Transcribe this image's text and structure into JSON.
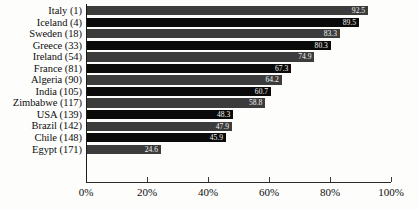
{
  "chart_data": {
    "type": "bar",
    "orientation": "horizontal",
    "title": "",
    "subtitle": "",
    "xlabel": "",
    "ylabel": "",
    "xlim": [
      0,
      100
    ],
    "grid": false,
    "legend": null,
    "value_suffix": "%",
    "categories": [
      "Italy (1)",
      "Iceland (4)",
      "Sweden (18)",
      "Greece (33)",
      "Ireland (54)",
      "France (81)",
      "Algeria (90)",
      "India (105)",
      "Zimbabwe (117)",
      "USA (139)",
      "Brazil (142)",
      "Chile (148)",
      "Egypt (171)"
    ],
    "values": [
      92.5,
      89.5,
      83.3,
      80.3,
      74.9,
      67.3,
      64.2,
      60.7,
      58.8,
      48.3,
      47.9,
      45.9,
      24.6
    ],
    "value_labels": [
      "92.5",
      "89.5",
      "83.3",
      "80.3",
      "74.9",
      "67.3",
      "64.2",
      "60.7",
      "58.8",
      "48.3",
      "47.9",
      "45.9",
      "24.6"
    ],
    "bar_colors": [
      "#3c3c3c",
      "#0a0a0a"
    ],
    "xticks": [
      0,
      20,
      40,
      60,
      80,
      100
    ],
    "xtick_labels": [
      "0%",
      "20%",
      "40%",
      "60%",
      "80%",
      "100%"
    ]
  }
}
